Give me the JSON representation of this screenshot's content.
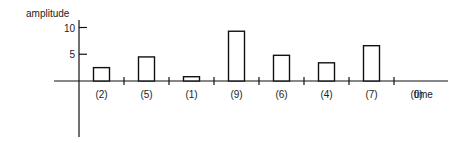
{
  "chart_data": {
    "type": "bar",
    "title": "",
    "ylabel": "amplitude",
    "xlabel": "time",
    "yticks": [
      5,
      10
    ],
    "ylim": [
      0,
      11
    ],
    "categories": [
      "(2)",
      "(5)",
      "(1)",
      "(9)",
      "(6)",
      "(4)",
      "(7)",
      "(0)"
    ],
    "values": [
      2.5,
      4.5,
      0.8,
      9.3,
      4.8,
      3.4,
      6.6,
      0
    ],
    "grid": false,
    "legend": "none"
  }
}
